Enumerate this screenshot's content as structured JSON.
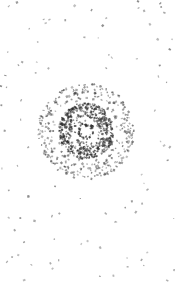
{
  "image": {
    "width": 175,
    "height": 285,
    "background": "#ffffff",
    "description": "Spiral vortex pattern of scattered dark particle marks on white",
    "center": {
      "x": 86,
      "y": 130
    },
    "ink_color": "#2a2a2a",
    "layers": [
      {
        "name": "inner-ring",
        "radius_min": 5,
        "radius_max": 8,
        "count": 40,
        "opacity": 0.85
      },
      {
        "name": "dense-spiral",
        "radius_min": 10,
        "radius_max": 28,
        "count": 520,
        "opacity": 0.75
      },
      {
        "name": "mid-halo",
        "radius_min": 28,
        "radius_max": 48,
        "count": 330,
        "opacity": 0.6
      },
      {
        "name": "outer-scatter",
        "radius_min": 48,
        "radius_max": 150,
        "count": 230,
        "opacity": 0.55
      }
    ],
    "seed": 7
  }
}
